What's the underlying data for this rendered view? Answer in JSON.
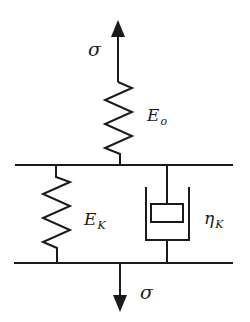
{
  "diagram": {
    "type": "rheological-model",
    "stroke_color": "#1a1a1a",
    "labels": {
      "sigma_top": "σ",
      "sigma_bottom": "σ",
      "E_o": {
        "base": "E",
        "sub": "o"
      },
      "E_K": {
        "base": "E",
        "sub": "K"
      },
      "eta_K": {
        "base": "η",
        "sub": "K"
      }
    },
    "elements": [
      {
        "id": "top-arrow",
        "kind": "force-arrow",
        "direction": "up",
        "label": "σ"
      },
      {
        "id": "spring-eo",
        "kind": "spring",
        "label": "E_o"
      },
      {
        "id": "top-bar",
        "kind": "rigid-bar"
      },
      {
        "id": "spring-ek",
        "kind": "spring",
        "label": "E_K"
      },
      {
        "id": "dashpot-etak",
        "kind": "dashpot",
        "label": "η_K"
      },
      {
        "id": "bottom-bar",
        "kind": "rigid-bar"
      },
      {
        "id": "bottom-arrow",
        "kind": "force-arrow",
        "direction": "down",
        "label": "σ"
      }
    ]
  }
}
